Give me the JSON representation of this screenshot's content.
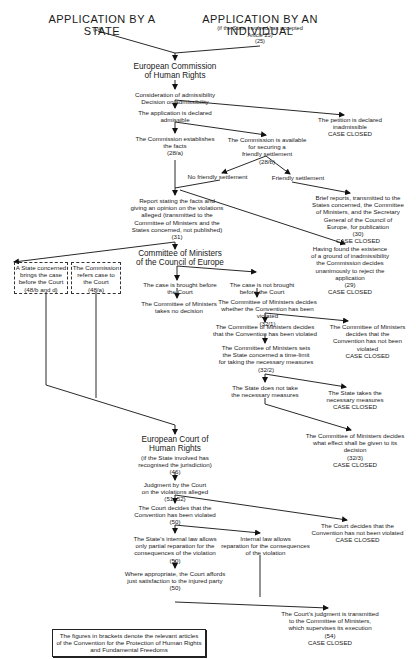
{
  "title_state": "APPLICATION BY A STATE",
  "title_state_ref": "(24)",
  "title_individual": "APPLICATION BY AN INDIVIDUAL",
  "title_individual_note": "(if the State involved has accepted\nArticle 25)\n(25)",
  "nodes": {
    "commission": "European Commission\nof Human Rights",
    "admissibility": "Consideration of admissibility\nDecision on admissibility",
    "declared_admissible": "The application is declared\nadmissible",
    "inadmissible": "The petition is declared\ninadmissible\nCASE CLOSED",
    "establishes_facts": "The Commission establishes\nthe facts\n(28/a)",
    "friendly_available": "The Commission is available\nfor securing a\nfriendly settlement\n(28/b)",
    "no_friendly": "No friendly settlement",
    "friendly": "Friendly settlement",
    "brief_reports": "Brief reports, transmitted to the\nStates concerned, the Committee\nof Ministers, and the Secretary\nGeneral of the Council of\nEurope, for publication\n(30)\nCASE CLOSED",
    "report": "Report stating the facts and\ngiving an opinion on the violations\nalleged (transmitted to the\nCommittee of Ministers and the\nStates concerned, not published)\n(31)",
    "ground_inadmissibility": "Having found the existence\nof a ground of inadmissibility\nthe Commission decides\nunanimously to reject the\napplication\n(29)\nCASE CLOSED",
    "committee": "Committee of Ministers\nof the Council of Europe",
    "state_brings": "A State concerned\nbrings the case\nbefore the Court\n(48/b and d)",
    "commission_refers": "The Commission\nrefers case to\nthe Court\n(48/a)",
    "brought_before": "The case is brought before\nthe Court",
    "not_brought": "The case is not brought\nbefore the Court",
    "no_decision": "The Committee of Ministers\ntakes no decision",
    "cm_decides_whether": "The Committee of Ministers decides\nwhether the Convention has been violated\n(32/1)",
    "cm_violated": "The Committee of Ministers decides\nthat the Convention has been violated",
    "cm_not_violated": "The Committee of Ministers\ndecides that the\nConvention has not been\nviolated\nCASE CLOSED",
    "time_limit": "The Committee of Ministers sets\nthe State concerned a time-limit\nfor taking the necessary measures\n(32/2)",
    "state_not_take": "The State does not take\nthe necessary measures",
    "state_takes": "The State takes the\nnecessary measures\nCASE CLOSED",
    "cm_effect": "The Committee of Ministers decides\nwhat effect shall be given to its\ndecision\n(32/3)\nCASE CLOSED",
    "court": "European Court of\nHuman Rights",
    "court_note": "(if the State involved has\nrecognised the jurisdiction)\n(46)",
    "judgment": "Judgment by the Court\non the violations alleged\n(51, 52)",
    "court_violated": "The Court decides that the\nConvention has been violated\n(50)",
    "court_not_violated": "The Court decides that the\nConvention has not been violated\nCASE CLOSED",
    "partial_reparation": "The State's internal law allows\nonly partial reparation for the\nconsequences of the violation\n(50)",
    "internal_law_allows": "Internal law allows\nreparation for the consequences\nof the violation",
    "just_satisfaction": "Where appropriate, the Court affords\njust satisfaction to the injured party\n(50)",
    "judgment_transmitted": "The Court's judgment is transmitted\nto the Committee of Ministers,\nwhich supervises its execution\n(54)\nCASE CLOSED"
  },
  "footnote": "The figures in brackets denote the relevant articles\nof the Convention for the Protection of Human Rights\nand Fundamental Freedoms"
}
